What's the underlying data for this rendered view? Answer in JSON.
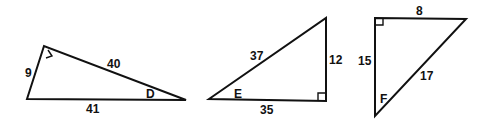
{
  "diagram": {
    "title": "",
    "colors": {
      "stroke": "#111111",
      "background": "#ffffff"
    },
    "triangles": [
      {
        "id": "triangle-D",
        "angle_label": "D",
        "sides": {
          "leg_short": "9",
          "leg_long": "40",
          "hypotenuse": "41"
        },
        "right_angle": "top-left vertex"
      },
      {
        "id": "triangle-E",
        "angle_label": "E",
        "sides": {
          "hypotenuse": "37",
          "leg_vertical": "12",
          "leg_horizontal": "35"
        },
        "right_angle": "bottom-right vertex"
      },
      {
        "id": "triangle-F",
        "angle_label": "F",
        "sides": {
          "leg_top": "8",
          "leg_vertical": "15",
          "hypotenuse": "17"
        },
        "right_angle": "top-left vertex"
      }
    ]
  }
}
